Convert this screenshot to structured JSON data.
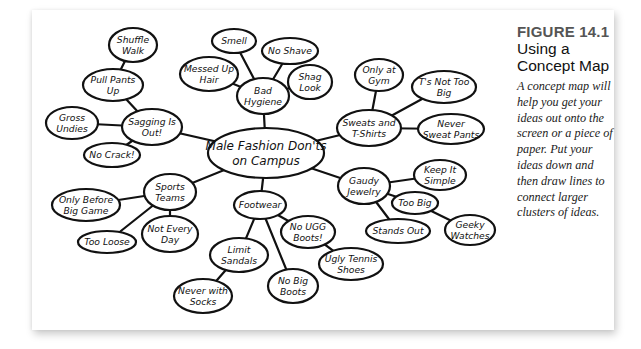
{
  "figure": {
    "number": "FIGURE 14.1",
    "title": "Using a Concept Map",
    "description": "A concept map will help you get your ideas out onto the screen or a piece of paper. Put your ideas down and then draw lines to connect larger clusters of ideas."
  },
  "concept_map": {
    "central": {
      "id": "main",
      "lines": [
        "Male Fashion Don'ts",
        "on Campus"
      ],
      "x": 266,
      "y": 153,
      "rx": 58,
      "ry": 25
    },
    "nodes": [
      {
        "id": "sagging",
        "lines": [
          "Sagging Is",
          "Out!"
        ],
        "x": 152,
        "y": 127,
        "rx": 30,
        "ry": 18,
        "parent": "main"
      },
      {
        "id": "pullpants",
        "lines": [
          "Pull Pants",
          "Up"
        ],
        "x": 113,
        "y": 85,
        "rx": 30,
        "ry": 16,
        "parent": "sagging"
      },
      {
        "id": "shuffle",
        "lines": [
          "Shuffle",
          "Walk"
        ],
        "x": 133,
        "y": 45,
        "rx": 24,
        "ry": 17,
        "parent": "pullpants"
      },
      {
        "id": "gross",
        "lines": [
          "Gross",
          "Undies"
        ],
        "x": 72,
        "y": 123,
        "rx": 26,
        "ry": 16,
        "parent": "sagging"
      },
      {
        "id": "nocrack",
        "lines": [
          "No Crack!"
        ],
        "x": 112,
        "y": 155,
        "rx": 28,
        "ry": 12,
        "parent": "sagging"
      },
      {
        "id": "hygiene",
        "lines": [
          "Bad",
          "Hygiene"
        ],
        "x": 263,
        "y": 96,
        "rx": 26,
        "ry": 18,
        "parent": "main"
      },
      {
        "id": "smell",
        "lines": [
          "Smell"
        ],
        "x": 234,
        "y": 41,
        "rx": 22,
        "ry": 12,
        "parent": "hygiene"
      },
      {
        "id": "noshave",
        "lines": [
          "No Shave"
        ],
        "x": 290,
        "y": 51,
        "rx": 28,
        "ry": 13,
        "parent": "hygiene"
      },
      {
        "id": "messed",
        "lines": [
          "Messed Up",
          "Hair"
        ],
        "x": 209,
        "y": 74,
        "rx": 29,
        "ry": 17,
        "parent": "hygiene"
      },
      {
        "id": "shag",
        "lines": [
          "Shag",
          "Look"
        ],
        "x": 310,
        "y": 82,
        "rx": 22,
        "ry": 17,
        "parent": "hygiene"
      },
      {
        "id": "sweats",
        "lines": [
          "Sweats and",
          "T-Shirts"
        ],
        "x": 369,
        "y": 128,
        "rx": 32,
        "ry": 18,
        "parent": "main"
      },
      {
        "id": "gym",
        "lines": [
          "Only at",
          "Gym"
        ],
        "x": 379,
        "y": 75,
        "rx": 24,
        "ry": 16,
        "parent": "sweats"
      },
      {
        "id": "tsnot",
        "lines": [
          "T's Not Too",
          "Big"
        ],
        "x": 444,
        "y": 87,
        "rx": 32,
        "ry": 16,
        "parent": "sweats"
      },
      {
        "id": "never",
        "lines": [
          "Never",
          "Sweat Pants"
        ],
        "x": 451,
        "y": 129,
        "rx": 33,
        "ry": 15,
        "parent": "sweats"
      },
      {
        "id": "gaudy",
        "lines": [
          "Gaudy",
          "Jewelry"
        ],
        "x": 364,
        "y": 186,
        "rx": 26,
        "ry": 18,
        "parent": "main"
      },
      {
        "id": "keep",
        "lines": [
          "Keep It",
          "Simple"
        ],
        "x": 440,
        "y": 175,
        "rx": 26,
        "ry": 15,
        "parent": "gaudy"
      },
      {
        "id": "toobig",
        "lines": [
          "Too Big"
        ],
        "x": 415,
        "y": 203,
        "rx": 23,
        "ry": 11,
        "parent": "gaudy"
      },
      {
        "id": "geeky",
        "lines": [
          "Geeky",
          "Watches"
        ],
        "x": 470,
        "y": 230,
        "rx": 25,
        "ry": 15,
        "parent": "toobig"
      },
      {
        "id": "stands",
        "lines": [
          "Stands Out"
        ],
        "x": 398,
        "y": 231,
        "rx": 32,
        "ry": 12,
        "parent": "gaudy"
      },
      {
        "id": "sports",
        "lines": [
          "Sports",
          "Teams"
        ],
        "x": 170,
        "y": 192,
        "rx": 26,
        "ry": 18,
        "parent": "main"
      },
      {
        "id": "onlybefore",
        "lines": [
          "Only Before",
          "Big Game"
        ],
        "x": 86,
        "y": 205,
        "rx": 34,
        "ry": 16,
        "parent": "sports"
      },
      {
        "id": "tooloose",
        "lines": [
          "Too Loose"
        ],
        "x": 107,
        "y": 242,
        "rx": 29,
        "ry": 11,
        "parent": "sports"
      },
      {
        "id": "notevery",
        "lines": [
          "Not Every",
          "Day"
        ],
        "x": 170,
        "y": 234,
        "rx": 28,
        "ry": 18,
        "parent": "sports"
      },
      {
        "id": "footwear",
        "lines": [
          "Footwear"
        ],
        "x": 260,
        "y": 205,
        "rx": 26,
        "ry": 14,
        "parent": "main"
      },
      {
        "id": "nougg",
        "lines": [
          "No UGG",
          "Boots!"
        ],
        "x": 308,
        "y": 232,
        "rx": 27,
        "ry": 16,
        "parent": "footwear"
      },
      {
        "id": "ugly",
        "lines": [
          "Ugly Tennis",
          "Shoes"
        ],
        "x": 351,
        "y": 264,
        "rx": 32,
        "ry": 16,
        "parent": "nougg"
      },
      {
        "id": "limit",
        "lines": [
          "Limit",
          "Sandals"
        ],
        "x": 239,
        "y": 255,
        "rx": 29,
        "ry": 17,
        "parent": "footwear"
      },
      {
        "id": "nobig",
        "lines": [
          "No Big",
          "Boots"
        ],
        "x": 293,
        "y": 286,
        "rx": 25,
        "ry": 17,
        "parent": "footwear"
      },
      {
        "id": "socks",
        "lines": [
          "Never with",
          "Socks"
        ],
        "x": 203,
        "y": 296,
        "rx": 29,
        "ry": 17,
        "parent": "limit"
      }
    ]
  }
}
